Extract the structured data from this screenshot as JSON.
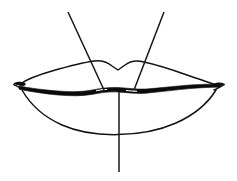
{
  "figure": {
    "title": "Lips line drawing with construction guides",
    "style": "black ink line art on white background",
    "background_color": "#ffffff",
    "ink_color": "#111111",
    "canvas": {
      "width": 237,
      "height": 181
    }
  },
  "parts": {
    "upper_lip_label": "upper lip outline",
    "cupids_bow_label": "cupid's bow notch",
    "lower_lip_label": "lower lip outline",
    "mouth_line_label": "mouth line (lip seam)",
    "left_corner_label": "left mouth corner",
    "right_corner_label": "right mouth corner",
    "left_guide_label": "left philtrum guide line",
    "right_guide_label": "right philtrum guide line",
    "center_guide_label": "vertical center guide line"
  },
  "geometry": {
    "mouth_center_x": 118,
    "mouth_line_y": 91,
    "upper_lip_top_y": 60,
    "lower_lip_bottom_y": 134,
    "left_corner_x": 18,
    "right_corner_x": 222,
    "left_guide": {
      "x1": 68,
      "y1": 12,
      "x2": 104,
      "y2": 90
    },
    "right_guide": {
      "x1": 164,
      "y1": 12,
      "x2": 134,
      "y2": 90
    },
    "center_guide": {
      "x1": 119,
      "y1": 92,
      "x2": 119,
      "y2": 172
    }
  }
}
